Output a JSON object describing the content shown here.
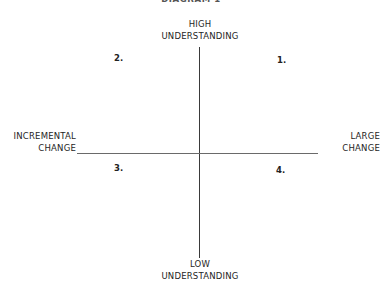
{
  "diagram": {
    "title": "DIAGRAM 1",
    "axes": {
      "vertical": {
        "top_label": [
          "HIGH",
          "UNDERSTANDING"
        ],
        "bottom_label": [
          "LOW",
          "UNDERSTANDING"
        ]
      },
      "horizontal": {
        "left_label": [
          "INCREMENTAL",
          "CHANGE"
        ],
        "right_label": [
          "LARGE",
          "CHANGE"
        ]
      }
    },
    "quadrants": [
      {
        "id": "1",
        "label": "1.",
        "position": "top-right"
      },
      {
        "id": "2",
        "label": "2.",
        "position": "top-left"
      },
      {
        "id": "3",
        "label": "3.",
        "position": "bottom-left"
      },
      {
        "id": "4",
        "label": "4.",
        "position": "bottom-right"
      }
    ]
  }
}
